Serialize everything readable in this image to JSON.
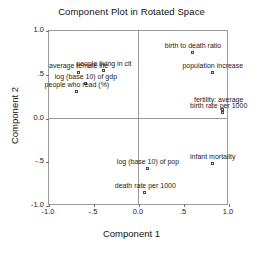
{
  "chart_data": {
    "type": "scatter",
    "title": "Component Plot in Rotated Space",
    "xlabel": "Component 1",
    "ylabel": "Component 2",
    "xlim": [
      -1.0,
      1.0
    ],
    "ylim": [
      -1.0,
      1.0
    ],
    "grid": false,
    "legend": "none",
    "xticks": [
      "-1.0",
      "-.5",
      "0.0",
      ".5",
      "1.0"
    ],
    "xtickvalues": [
      -1.0,
      -0.5,
      0.0,
      0.5,
      1.0
    ],
    "yticks": [
      "1.0",
      ".5",
      "0.0",
      "-.5",
      "-1.0"
    ],
    "ytickvalues": [
      1.0,
      0.5,
      0.0,
      -0.5,
      -1.0
    ],
    "points": [
      {
        "label": "birth to death ratio",
        "x": 0.6,
        "y": 0.75,
        "label_dx": 0,
        "label_dy": -3
      },
      {
        "label": "population increase",
        "x": 0.82,
        "y": 0.52,
        "label_dx": 0,
        "label_dy": -3
      },
      {
        "label": "fertility: average",
        "x": 0.93,
        "y": 0.1,
        "label_dx": -4,
        "label_dy": -6
      },
      {
        "label": "birth rate per 1000",
        "x": 0.93,
        "y": 0.06,
        "label_dx": -4,
        "label_dy": -3
      },
      {
        "label": "infant mortality",
        "x": 0.82,
        "y": -0.52,
        "label_dx": 0,
        "label_dy": -3
      },
      {
        "label": "log (base 10) of pop",
        "x": 0.1,
        "y": -0.58,
        "label_dx": 0,
        "label_dy": -3
      },
      {
        "label": "death rate per 1000",
        "x": 0.07,
        "y": -0.85,
        "label_dx": 0,
        "label_dy": -3
      },
      {
        "label": "people living in cit",
        "x": -0.39,
        "y": 0.54,
        "label_dx": 0,
        "label_dy": -3
      },
      {
        "label": "average female life",
        "x": -0.67,
        "y": 0.52,
        "label_dx": 0,
        "label_dy": -3
      },
      {
        "label": "log (base 10) of gdp",
        "x": -0.59,
        "y": 0.4,
        "label_dx": 0,
        "label_dy": -3
      },
      {
        "label": "people who read (%)",
        "x": -0.69,
        "y": 0.3,
        "label_dx": 0,
        "label_dy": -3
      }
    ]
  }
}
